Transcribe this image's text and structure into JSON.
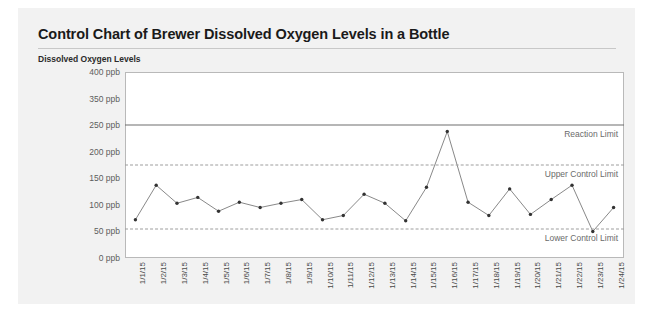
{
  "card": {
    "title": "Control Chart of Brewer Dissolved Oxygen Levels in a Bottle",
    "subtitle": "Dissolved Oxygen Levels"
  },
  "chart_data": {
    "type": "line",
    "title": "Control Chart of Brewer Dissolved Oxygen Levels in a Bottle",
    "subtitle": "Dissolved Oxygen Levels",
    "xlabel": "",
    "ylabel": "Dissolved Oxygen Levels",
    "unit": "ppb",
    "grid": false,
    "legend": "none",
    "marker": "circle",
    "line_color": "#7a7a7a",
    "marker_color": "#333333",
    "ytick_labels": [
      "400 ppb",
      "350 ppb",
      "250 ppb",
      "200 ppb",
      "150 ppb",
      "100 ppb",
      "50 ppb",
      "0 ppb"
    ],
    "ytick_values": [
      400,
      350,
      250,
      200,
      150,
      100,
      50,
      0
    ],
    "categories": [
      "1/1/15",
      "1/2/15",
      "1/3/15",
      "1/4/15",
      "1/5/15",
      "1/6/15",
      "1/7/15",
      "1/8/15",
      "1/9/15",
      "1/10/15",
      "1/11/15",
      "1/12/15",
      "1/13/15",
      "1/14/15",
      "1/15/15",
      "1/16/15",
      "1/17/15",
      "1/18/15",
      "1/19/15",
      "1/20/15",
      "1/21/15",
      "1/22/15",
      "1/23/15",
      "1/24/15"
    ],
    "values": [
      72,
      137,
      103,
      114,
      88,
      105,
      95,
      103,
      110,
      72,
      80,
      120,
      103,
      70,
      133,
      238,
      105,
      80,
      130,
      82,
      110,
      137,
      50,
      95
    ],
    "reference_lines": [
      {
        "label": "Reaction Limit",
        "value": 250,
        "style": "solid",
        "color": "#6e6e6e"
      },
      {
        "label": "Upper Control Limit",
        "value": 175,
        "style": "dashed",
        "color": "#9d9d9d"
      },
      {
        "label": "Lower Control Limit",
        "value": 55,
        "style": "dashed",
        "color": "#9d9d9d"
      }
    ]
  }
}
